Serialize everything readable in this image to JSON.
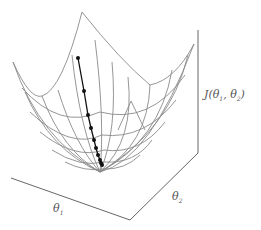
{
  "figure": {
    "title": ""
  },
  "labels": {
    "z_axis": {
      "prefix": "J(",
      "theta1": "θ",
      "sub1": "1",
      "sep": ", ",
      "theta2": "θ",
      "sub2": "2",
      "suffix": ")"
    },
    "x_axis": {
      "symbol": "θ",
      "sub": "1"
    },
    "y_axis": {
      "symbol": "θ",
      "sub": "2"
    }
  },
  "colors": {
    "mesh": "#8a8a8a",
    "axis": "#555555",
    "path": "#111111",
    "label": "#555555"
  },
  "descent_path": {
    "points": [
      [
        78,
        58
      ],
      [
        84,
        91
      ],
      [
        88,
        115
      ],
      [
        91,
        128
      ],
      [
        94,
        140
      ],
      [
        96,
        148
      ],
      [
        98,
        155
      ],
      [
        100,
        160
      ],
      [
        101,
        163
      ],
      [
        102,
        165
      ]
    ]
  }
}
